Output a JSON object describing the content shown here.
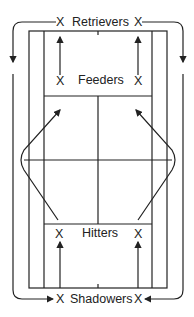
{
  "diagram": {
    "marker": "X",
    "labels": {
      "retrievers": "Retrievers",
      "feeders": "Feeders",
      "hitters": "Hitters",
      "shadowers": "Shadowers"
    },
    "colors": {
      "line": "#222222",
      "background": "#ffffff"
    }
  }
}
